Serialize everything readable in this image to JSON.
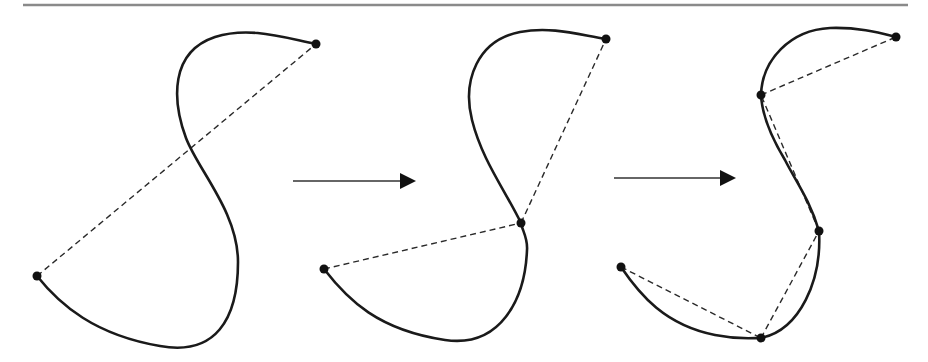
{
  "figure": {
    "colors": {
      "curve": "#1a1a1a",
      "chord": "#2a2a2a",
      "vertex": "#111111",
      "arrow": "#333333",
      "top_rule": "#8a8a8a",
      "background": "#ffffff"
    },
    "top_rule": {
      "x1": 23,
      "y1": 5,
      "x2": 908,
      "y2": 5
    },
    "stages": [
      {
        "name": "stage-1",
        "curve_path": "M37,276 C60,305 95,335 160,346 C215,356 238,320 238,262 C238,212 198,170 186,138 C172,100 170,52 215,37 C250,26 285,38 316,44",
        "vertices": [
          [
            37,
            276
          ],
          [
            316,
            44
          ]
        ],
        "chords": [
          [
            [
              37,
              276
            ],
            [
              316,
              44
            ]
          ]
        ]
      },
      {
        "name": "stage-2",
        "curve_path": "M324,269 C348,300 378,330 445,340 C500,348 525,300 527,250 C528,238 522,230 521,223 C505,190 482,160 472,120 C462,80 478,40 520,32 C552,26 580,35 606,39",
        "vertices": [
          [
            324,
            269
          ],
          [
            521,
            223
          ],
          [
            606,
            39
          ]
        ],
        "chords": [
          [
            [
              324,
              269
            ],
            [
              521,
              223
            ]
          ],
          [
            [
              521,
              223
            ],
            [
              606,
              39
            ]
          ]
        ]
      },
      {
        "name": "stage-3",
        "curve_path": "M621,267 C640,295 665,325 715,335 C740,340 752,338 761,338 C800,330 822,280 819,231 C810,200 795,180 785,160 C770,135 762,115 761,95 C762,60 790,30 830,28 C858,27 880,33 896,37",
        "vertices": [
          [
            621,
            267
          ],
          [
            761,
            338
          ],
          [
            819,
            231
          ],
          [
            761,
            95
          ],
          [
            896,
            37
          ]
        ],
        "chords": [
          [
            [
              621,
              267
            ],
            [
              761,
              338
            ]
          ],
          [
            [
              761,
              338
            ],
            [
              819,
              231
            ]
          ],
          [
            [
              819,
              231
            ],
            [
              761,
              95
            ]
          ],
          [
            [
              761,
              95
            ],
            [
              896,
              37
            ]
          ]
        ]
      }
    ],
    "arrows": [
      {
        "name": "arrow-1",
        "x1": 293,
        "y1": 181,
        "x2": 416,
        "y2": 181
      },
      {
        "name": "arrow-2",
        "x1": 614,
        "y1": 178,
        "x2": 736,
        "y2": 178
      }
    ]
  }
}
